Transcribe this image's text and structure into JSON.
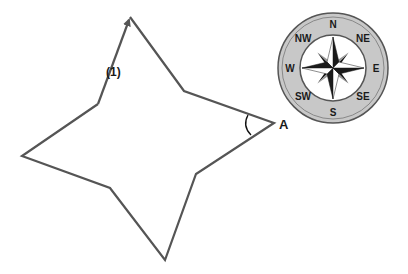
{
  "diagram": {
    "type": "star-path-with-compass",
    "shape": {
      "name": "four-pointed star path",
      "stroke_color": "#555555",
      "vertices": [
        [
          130,
          17
        ],
        [
          184,
          91
        ],
        [
          274,
          123
        ],
        [
          196,
          174
        ],
        [
          165,
          260
        ],
        [
          110,
          188
        ],
        [
          22,
          156
        ],
        [
          98,
          104
        ]
      ],
      "start_arrow_label": "(1)",
      "angle_vertex_label": "A"
    },
    "compass": {
      "center": [
        333,
        68
      ],
      "outer_radius": 55,
      "inner_radius": 33,
      "ring_color": "#c8c8c8",
      "labels": {
        "N": "N",
        "NE": "NE",
        "E": "E",
        "SE": "SE",
        "S": "S",
        "SW": "SW",
        "W": "W",
        "NW": "NW"
      }
    }
  }
}
